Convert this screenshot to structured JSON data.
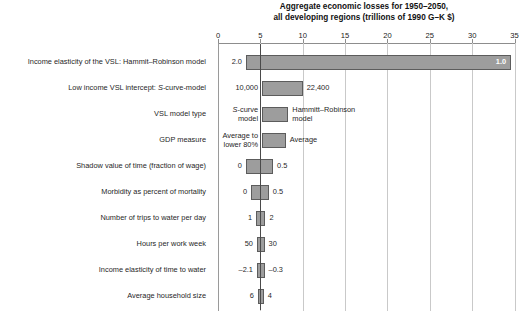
{
  "chart_data": {
    "type": "bar",
    "orientation": "horizontal-tornado",
    "title": "Aggregate economic losses for 1950–2050,\nall developing regions (trillions of 1990 G–K $)",
    "title_line1": "Aggregate economic losses for 1950–2050,",
    "title_line2": "all developing regions (trillions of 1990 G–K $)",
    "xlabel": "",
    "ylabel": "",
    "xlim": [
      0,
      35
    ],
    "xticks": [
      0,
      5,
      10,
      15,
      20,
      25,
      30,
      35
    ],
    "xticklabels": [
      "0",
      "5",
      "10",
      "15",
      "20",
      "25",
      "30",
      "35"
    ],
    "grid": true,
    "baseline": 5,
    "legend": "none",
    "categories": [
      "Income elasticity of the VSL: Hammit–Robinson model",
      "Low income VSL intercept: S-curve-model",
      "VSL model type",
      "GDP measure",
      "Shadow value of time (fraction of wage)",
      "Morbidity as percent of mortality",
      "Number of trips to water per day",
      "Hours per work week",
      "Income elasticity of time to water",
      "Average household size"
    ],
    "bars": [
      {
        "category": "Income elasticity of the VSL: Hammit–Robinson model",
        "low": 3.3,
        "high": 34.6,
        "low_label": "2.0",
        "high_label": "1.0",
        "high_label_inside": true,
        "low_label_italic": false
      },
      {
        "category": "Low income VSL intercept: S-curve-model",
        "low": 5.2,
        "high": 10.0,
        "low_label": "10,000",
        "high_label": "22,400",
        "high_label_inside": false
      },
      {
        "category": "VSL model type",
        "low": 5.2,
        "high": 8.3,
        "low_label": "S-curve\nmodel",
        "low_label_italic_first": "S",
        "high_label": "Hammitt–Robinson\nmodel",
        "high_label_inside": false
      },
      {
        "category": "GDP measure",
        "low": 5.2,
        "high": 8.0,
        "low_label": "Average to\nlower 80%",
        "high_label": "Average",
        "high_label_inside": false
      },
      {
        "category": "Shadow value of time (fraction of wage)",
        "low": 3.3,
        "high": 6.5,
        "low_label": "0",
        "high_label": "0.5",
        "high_label_inside": false
      },
      {
        "category": "Morbidity as percent of mortality",
        "low": 3.9,
        "high": 6.0,
        "low_label": "0",
        "high_label": "0.5",
        "high_label_inside": false
      },
      {
        "category": "Number of trips to water per day",
        "low": 4.5,
        "high": 5.6,
        "low_label": "1",
        "high_label": "2",
        "high_label_inside": false
      },
      {
        "category": "Hours per work week",
        "low": 4.6,
        "high": 5.5,
        "low_label": "50",
        "high_label": "30",
        "high_label_inside": false
      },
      {
        "category": "Income elasticity of time to water",
        "low": 4.6,
        "high": 5.5,
        "low_label": "–2.1",
        "high_label": "–0.3",
        "high_label_inside": false
      },
      {
        "category": "Average household size",
        "low": 4.7,
        "high": 5.4,
        "low_label": "6",
        "high_label": "4",
        "high_label_inside": false
      }
    ],
    "colors": {
      "bar_fill": "#9d9d9d",
      "bar_edge": "#5c5c5c",
      "grid": "#c9c9c9",
      "reference_line": "#4a4a4a",
      "inside_label": "#ffffff",
      "text": "#1f1f1f",
      "background": "#ffffff"
    }
  }
}
